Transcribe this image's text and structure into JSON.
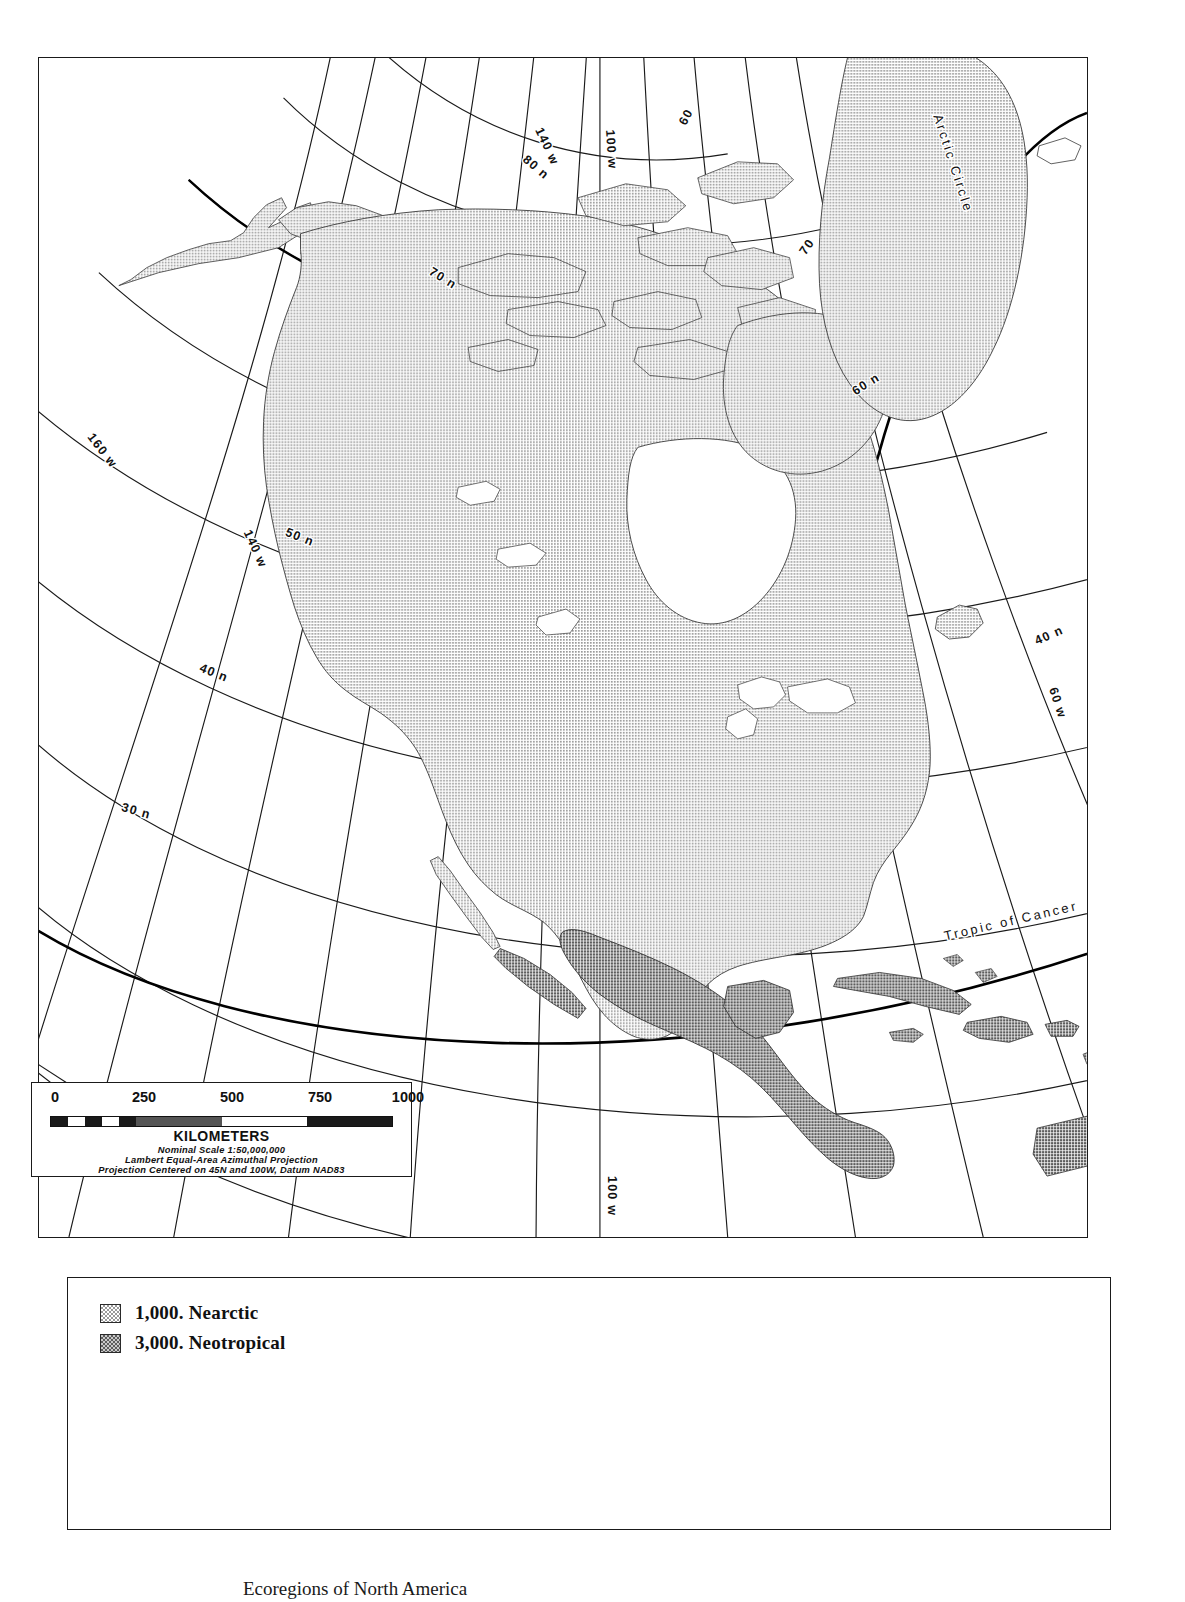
{
  "map": {
    "title": "Ecoregions of North America",
    "projection_note": "Lambert Equal-Area Azimuthal Projection",
    "graticule_labels": [
      {
        "id": "lon-140-top",
        "text": "140 w"
      },
      {
        "id": "lon-100-top",
        "text": "100 w"
      },
      {
        "id": "lat-80",
        "text": "80 n"
      },
      {
        "id": "lon-60-top",
        "text": "60"
      },
      {
        "id": "lat-70-left",
        "text": "70 n"
      },
      {
        "id": "lat-70-right",
        "text": "70"
      },
      {
        "id": "lon-160",
        "text": "160 w"
      },
      {
        "id": "lon-140-left",
        "text": "140 w"
      },
      {
        "id": "lat-50",
        "text": "50 n"
      },
      {
        "id": "lat-60-right",
        "text": "60 n"
      },
      {
        "id": "lat-40-left",
        "text": "40 n"
      },
      {
        "id": "lat-40-right",
        "text": "40 n"
      },
      {
        "id": "lon-60-right",
        "text": "60 w"
      },
      {
        "id": "lat-30",
        "text": "30 n"
      },
      {
        "id": "lon-100-bottom",
        "text": "100 w"
      }
    ],
    "special_lines": [
      {
        "id": "arctic-circle",
        "text": "Arctic Circle"
      },
      {
        "id": "tropic-of-cancer",
        "text": "Tropic of Cancer"
      }
    ],
    "colors": {
      "nearctic_fill": "#b9b9b9",
      "neotropical_fill": "#8d8d8d",
      "graticule": "#1a1a1a",
      "special_line": "#000000",
      "frame": "#1a1a1a",
      "background": "#ffffff"
    }
  },
  "scale_bar": {
    "ticks": [
      "0",
      "250",
      "500",
      "750",
      "1000"
    ],
    "units_label": "KILOMETERS",
    "nominal_scale": "Nominal Scale 1:50,000,000",
    "projection": "Lambert Equal-Area Azimuthal Projection",
    "datum": "Projection Centered on 45N and 100W, Datum NAD83"
  },
  "legend": {
    "items": [
      {
        "code": "1,000.",
        "label": "Nearctic",
        "text": "1,000.  Nearctic",
        "color": "#b9b9b9"
      },
      {
        "code": "3,000.",
        "label": "Neotropical",
        "text": "3,000.  Neotropical",
        "color": "#8d8d8d"
      }
    ]
  },
  "caption": {
    "text": "Ecoregions of North America"
  }
}
